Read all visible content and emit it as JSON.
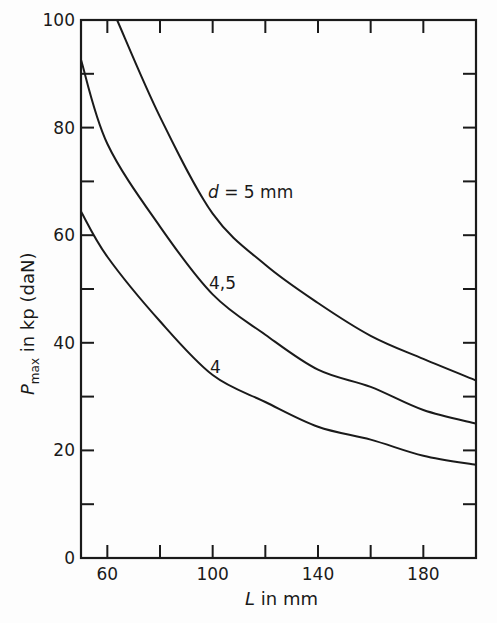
{
  "chart_data": {
    "type": "line",
    "title": "",
    "xlabel": "L in mm",
    "ylabel": "P_max in kp (daN)",
    "xlim": [
      50,
      200
    ],
    "ylim": [
      0,
      100
    ],
    "x_ticks": [
      60,
      80,
      100,
      120,
      140,
      160,
      180
    ],
    "x_tick_labels": [
      "60",
      "",
      "100",
      "",
      "140",
      "",
      "180"
    ],
    "y_ticks": [
      0,
      10,
      20,
      30,
      40,
      50,
      60,
      70,
      80,
      90,
      100
    ],
    "y_tick_labels": [
      "0",
      "",
      "20",
      "",
      "40",
      "",
      "60",
      "",
      "80",
      "",
      "100"
    ],
    "grid": false,
    "legend": "inline curve labels",
    "series": [
      {
        "name": "d = 5 mm",
        "label": "d = 5 mm",
        "x": [
          63.7,
          80,
          100,
          120,
          140,
          160,
          180,
          200
        ],
        "y": [
          100,
          82,
          64,
          54.5,
          47.4,
          41.3,
          37,
          33
        ]
      },
      {
        "name": "d = 4,5 mm",
        "label": "4,5",
        "x": [
          50,
          60,
          80,
          100,
          120,
          140,
          160,
          180,
          200
        ],
        "y": [
          92.6,
          77,
          61.6,
          49,
          41.5,
          35,
          31.8,
          27.5,
          25
        ]
      },
      {
        "name": "d = 4 mm",
        "label": "4",
        "x": [
          50,
          60,
          80,
          100,
          120,
          140,
          160,
          180,
          200
        ],
        "y": [
          64.4,
          56,
          44,
          34,
          29,
          24.4,
          22,
          19,
          17.3
        ]
      }
    ]
  },
  "labels": {
    "x_axis": "L in mm",
    "x_axis_var": "L",
    "x_axis_rest": " in mm",
    "y_axis_var": "P",
    "y_axis_sub": "max",
    "y_axis_rest": " in kp (daN)",
    "curve_d5_var": "d",
    "curve_d5_rest": " = 5 mm",
    "curve_d45": "4,5",
    "curve_d4": "4"
  }
}
